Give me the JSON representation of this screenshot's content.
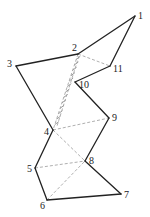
{
  "diagram": {
    "vertices": [
      {
        "id": "1",
        "label": "1",
        "x": 135,
        "y": 16,
        "lx": 138,
        "ly": 19
      },
      {
        "id": "2",
        "label": "2",
        "x": 78,
        "y": 54,
        "lx": 72,
        "ly": 51
      },
      {
        "id": "3",
        "label": "3",
        "x": 16,
        "y": 66,
        "lx": 7,
        "ly": 67
      },
      {
        "id": "4",
        "label": "4",
        "x": 53,
        "y": 130,
        "lx": 44,
        "ly": 135
      },
      {
        "id": "5",
        "label": "5",
        "x": 35,
        "y": 168,
        "lx": 27,
        "ly": 172
      },
      {
        "id": "6",
        "label": "6",
        "x": 47,
        "y": 200,
        "lx": 40,
        "ly": 209
      },
      {
        "id": "7",
        "label": "7",
        "x": 121,
        "y": 194,
        "lx": 124,
        "ly": 198
      },
      {
        "id": "8",
        "label": "8",
        "x": 85,
        "y": 161,
        "lx": 89,
        "ly": 164
      },
      {
        "id": "9",
        "label": "9",
        "x": 109,
        "y": 118,
        "lx": 112,
        "ly": 121
      },
      {
        "id": "10",
        "label": "10",
        "x": 75,
        "y": 82,
        "lx": 79,
        "ly": 88
      },
      {
        "id": "11",
        "label": "11",
        "x": 110,
        "y": 66,
        "lx": 113,
        "ly": 72
      }
    ],
    "solid_edges": [
      [
        "1",
        "2"
      ],
      [
        "2",
        "3"
      ],
      [
        "3",
        "4"
      ],
      [
        "4",
        "5"
      ],
      [
        "5",
        "6"
      ],
      [
        "6",
        "7"
      ],
      [
        "7",
        "8"
      ],
      [
        "8",
        "9"
      ],
      [
        "9",
        "10"
      ],
      [
        "10",
        "11"
      ],
      [
        "11",
        "1"
      ]
    ],
    "dashed_edges": [
      [
        "2",
        "11"
      ],
      [
        "4",
        "9"
      ],
      [
        "4",
        "8"
      ],
      [
        "5",
        "8"
      ],
      [
        "6",
        "8"
      ],
      [
        "2",
        "4"
      ]
    ],
    "hatched_region": [
      "2",
      "10",
      "4"
    ],
    "colors": {
      "solid": "#222222",
      "dashed": "#9a9a9a",
      "hatch": "#555555",
      "background": "#ffffff"
    }
  }
}
